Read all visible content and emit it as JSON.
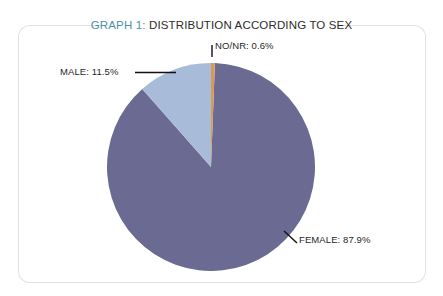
{
  "figure": {
    "title_prefix": "GRAPH 1:",
    "title_rest": " DISTRIBUTION ACCORDING TO SEX",
    "frame_color": "#e2e2e4",
    "background": "#ffffff"
  },
  "chart_data": {
    "type": "pie",
    "title": "GRAPH 1: DISTRIBUTION ACCORDING TO SEX",
    "categories": [
      "FEMALE",
      "MALE",
      "NO/NR"
    ],
    "values": [
      87.9,
      11.5,
      0.6
    ],
    "value_unit": "%",
    "labels": [
      "FEMALE: 87.9%",
      "MALE: 11.5%",
      "NO/NR: 0.6%"
    ],
    "colors": [
      "#6b6a92",
      "#a8bbd8",
      "#d79a58"
    ],
    "legend": "none",
    "grid": false,
    "start_angle_deg": 0,
    "direction": "clockwise",
    "center": {
      "x": 211,
      "y": 167
    },
    "radius": 104,
    "slices": [
      {
        "name": "NO/NR",
        "label": "NO/NR: 0.6%",
        "value": 0.6,
        "color": "#d79a58",
        "start_deg": 0,
        "end_deg": 2.16
      },
      {
        "name": "FEMALE",
        "label": "FEMALE: 87.9%",
        "value": 87.9,
        "color": "#6b6a92",
        "start_deg": 2.16,
        "end_deg": 318.6
      },
      {
        "name": "MALE",
        "label": "MALE: 11.5%",
        "value": 11.5,
        "color": "#a8bbd8",
        "start_deg": 318.6,
        "end_deg": 360
      }
    ]
  },
  "callouts": {
    "nonr": "NO/NR: 0.6%",
    "male": "MALE: 11.5%",
    "female": "FEMALE: 87.9%"
  }
}
